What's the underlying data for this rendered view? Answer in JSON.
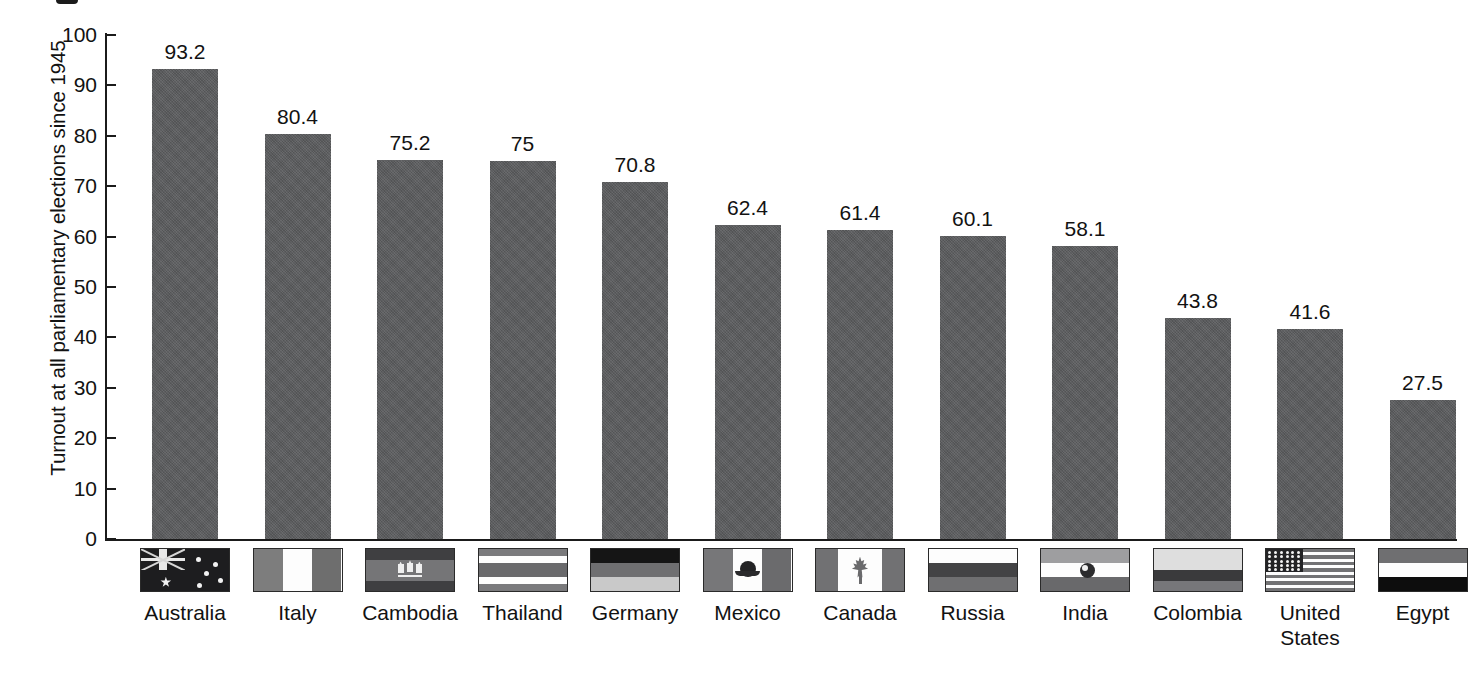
{
  "chart_data": {
    "type": "bar",
    "title": "",
    "xlabel": "",
    "ylabel": "Turnout at all parliamentary elections since 1945",
    "ylim": [
      0,
      100
    ],
    "yticks": [
      "0",
      "10",
      "20",
      "30",
      "40",
      "50",
      "60",
      "70",
      "80",
      "90",
      "100"
    ],
    "grid": false,
    "legend": "none",
    "bar_color": "#5a5b5d",
    "categories": [
      "Australia",
      "Italy",
      "Cambodia",
      "Thailand",
      "Germany",
      "Mexico",
      "Canada",
      "Russia",
      "India",
      "Colombia",
      "United States",
      "Egypt"
    ],
    "value_labels": [
      "93.2",
      "80.4",
      "75.2",
      "75",
      "70.8",
      "62.4",
      "61.4",
      "60.1",
      "58.1",
      "43.8",
      "41.6",
      "27.5"
    ],
    "values": [
      93.2,
      80.4,
      75.2,
      75,
      70.8,
      62.4,
      61.4,
      60.1,
      58.1,
      43.8,
      41.6,
      27.5
    ],
    "bars": [
      {
        "category": "Australia",
        "value": 93.2,
        "label": "93.2",
        "flag": "australia-flag"
      },
      {
        "category": "Italy",
        "value": 80.4,
        "label": "80.4",
        "flag": "italy-flag"
      },
      {
        "category": "Cambodia",
        "value": 75.2,
        "label": "75.2",
        "flag": "cambodia-flag"
      },
      {
        "category": "Thailand",
        "value": 75.0,
        "label": "75",
        "flag": "thailand-flag"
      },
      {
        "category": "Germany",
        "value": 70.8,
        "label": "70.8",
        "flag": "germany-flag"
      },
      {
        "category": "Mexico",
        "value": 62.4,
        "label": "62.4",
        "flag": "mexico-flag"
      },
      {
        "category": "Canada",
        "value": 61.4,
        "label": "61.4",
        "flag": "canada-flag"
      },
      {
        "category": "Russia",
        "value": 60.1,
        "label": "60.1",
        "flag": "russia-flag"
      },
      {
        "category": "India",
        "value": 58.1,
        "label": "58.1",
        "flag": "india-flag"
      },
      {
        "category": "Colombia",
        "value": 43.8,
        "label": "43.8",
        "flag": "colombia-flag"
      },
      {
        "category": "United States",
        "value": 41.6,
        "label": "41.6",
        "flag": "united-states-flag"
      },
      {
        "category": "Egypt",
        "value": 27.5,
        "label": "27.5",
        "flag": "egypt-flag"
      }
    ]
  },
  "axis": {
    "y_title": "Turnout at all parliamentary elections since 1945",
    "y_ticks": [
      "100",
      "90",
      "80",
      "70",
      "60",
      "50",
      "40",
      "30",
      "20",
      "10",
      "0"
    ]
  },
  "country_label_lines": [
    [
      "Australia"
    ],
    [
      "Italy"
    ],
    [
      "Cambodia"
    ],
    [
      "Thailand"
    ],
    [
      "Germany"
    ],
    [
      "Mexico"
    ],
    [
      "Canada"
    ],
    [
      "Russia"
    ],
    [
      "India"
    ],
    [
      "Colombia"
    ],
    [
      "United",
      "States"
    ],
    [
      "Egypt"
    ]
  ]
}
